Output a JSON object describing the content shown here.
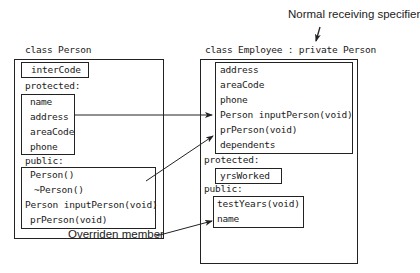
{
  "annotations": {
    "top_right": "Normal receiving specifier",
    "bottom_left": "Overriden member"
  },
  "base_class": {
    "title": "class Person",
    "private_members": [
      "interCode"
    ],
    "protected_label": "protected:",
    "protected_members": [
      "name",
      "address",
      "areaCode",
      "phone"
    ],
    "public_label": "public:",
    "public_members": [
      "Person()",
      "~Person()",
      "Person inputPerson(void)",
      "prPerson(void)"
    ]
  },
  "derived_class": {
    "title": "class Employee : private Person",
    "inherited_private_members": [
      "address",
      "areaCode",
      "phone",
      "Person inputPerson(void)",
      "prPerson(void)",
      "dependents"
    ],
    "protected_label": "protected:",
    "protected_members": [
      "yrsWorked"
    ],
    "public_label": "public:",
    "public_members": [
      "testYears(void)",
      "name"
    ]
  },
  "colors": {
    "line": "#222222",
    "background": "#ffffff"
  }
}
